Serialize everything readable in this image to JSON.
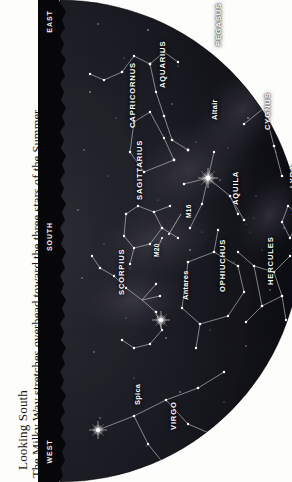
{
  "caption": {
    "title": "Looking South",
    "body_line1": "The Milky Way stretches overhead toward the three stars of the Summer",
    "body_line2": "Triangle. Look low in the south for the bright star Antares in Scorpius."
  },
  "compass": {
    "east": "EAST",
    "south": "SOUTH",
    "west": "WEST"
  },
  "chart_data": {
    "type": "scatter",
    "title": "Looking South",
    "projection": "half-dome sky chart, horizon at left edge, zenith at right",
    "xlabel": "azimuth along horizon (EAST - SOUTH - WEST)",
    "ylabel": "altitude above horizon",
    "grid": false,
    "legend": false,
    "constellations": [
      {
        "label": "PEGASUS",
        "x": 176,
        "y": 46,
        "rot": -90
      },
      {
        "label": "AQUARIUS",
        "x": 120,
        "y": 88,
        "rot": -90
      },
      {
        "label": "CAPRICORNUS",
        "x": 90,
        "y": 128,
        "rot": -90
      },
      {
        "label": "SAGITTARIUS",
        "x": 97,
        "y": 200,
        "rot": -90
      },
      {
        "label": "SCORPIUS",
        "x": 79,
        "y": 295,
        "rot": -90
      },
      {
        "label": "VIRGO",
        "x": 131,
        "y": 430,
        "rot": -90
      },
      {
        "label": "AQUILA",
        "x": 193,
        "y": 205,
        "rot": -90
      },
      {
        "label": "CYGNUS",
        "x": 225,
        "y": 130,
        "rot": -90
      },
      {
        "label": "LYRA",
        "x": 250,
        "y": 188,
        "rot": -90
      },
      {
        "label": "HERCULES",
        "x": 228,
        "y": 285,
        "rot": -90
      },
      {
        "label": "OPHIUCHUS",
        "x": 180,
        "y": 292,
        "rot": -90
      }
    ],
    "named_stars": [
      {
        "label": "Altair",
        "x": 172,
        "y": 120,
        "mag": 0.8,
        "sx": 170,
        "sy": 178
      },
      {
        "label": "Vega",
        "x": 252,
        "y": 215,
        "mag": 0.0,
        "sx": 271,
        "sy": 236
      },
      {
        "label": "Antares",
        "x": 143,
        "y": 300,
        "mag": 1.1,
        "sx": 123,
        "sy": 320
      },
      {
        "label": "Spica",
        "x": 95,
        "y": 405,
        "mag": 1.0,
        "sx": 60,
        "sy": 430
      }
    ],
    "deep_sky_objects": [
      {
        "label": "M16",
        "x": 147,
        "y": 218,
        "px": 131,
        "py": 234
      },
      {
        "label": "M20",
        "x": 115,
        "y": 257,
        "px": 122,
        "py": 239
      }
    ],
    "horizon_markers": [
      {
        "label": "EAST",
        "position": 0.04
      },
      {
        "label": "SOUTH",
        "position": 0.5
      },
      {
        "label": "WEST",
        "position": 0.96
      }
    ]
  }
}
